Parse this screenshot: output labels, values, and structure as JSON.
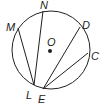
{
  "diagram": {
    "type": "circle-chords",
    "stroke_color": "#231f20",
    "background": "#ffffff",
    "circle": {
      "center_label": "O",
      "cx": 51,
      "cy": 50,
      "r": 39
    },
    "points": {
      "M": {
        "label": "M",
        "x": 18,
        "y": 28
      },
      "N": {
        "label": "N",
        "x": 43,
        "y": 11
      },
      "D": {
        "label": "D",
        "x": 80,
        "y": 27
      },
      "C": {
        "label": "C",
        "x": 88,
        "y": 53
      },
      "L": {
        "label": "L",
        "x": 34,
        "y": 85
      },
      "E": {
        "label": "E",
        "x": 43,
        "y": 89
      }
    },
    "chords": [
      {
        "from": "M",
        "to": "L"
      },
      {
        "from": "N",
        "to": "L"
      },
      {
        "from": "D",
        "to": "E"
      },
      {
        "from": "C",
        "to": "E"
      }
    ],
    "labels": {
      "M": "M",
      "N": "N",
      "D": "D",
      "C": "C",
      "O": "O",
      "L": "L",
      "E": "E"
    }
  }
}
